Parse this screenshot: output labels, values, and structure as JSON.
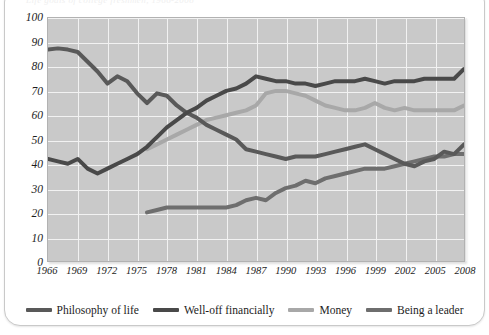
{
  "figure": {
    "clipped_title": "Life goals of college freshmen, 1966-2008",
    "plot_background": "#c9c9c9",
    "gridline_color": "#f2f2f2"
  },
  "chart_data": {
    "type": "line",
    "title": "",
    "xlabel": "",
    "ylabel": "",
    "xlim": [
      1966,
      2008
    ],
    "ylim": [
      0,
      100
    ],
    "grid": true,
    "legend_position": "bottom",
    "x_ticks": [
      1966,
      1969,
      1972,
      1975,
      1978,
      1981,
      1984,
      1987,
      1990,
      1993,
      1996,
      1999,
      2002,
      2005,
      2008
    ],
    "y_ticks": [
      0,
      10,
      20,
      30,
      40,
      50,
      60,
      70,
      80,
      90,
      100
    ],
    "series": [
      {
        "name": "Philosophy of life",
        "color": "#595959",
        "x": [
          1966,
          1967,
          1968,
          1969,
          1970,
          1971,
          1972,
          1973,
          1974,
          1975,
          1976,
          1977,
          1978,
          1979,
          1980,
          1981,
          1982,
          1983,
          1984,
          1985,
          1986,
          1987,
          1988,
          1989,
          1990,
          1991,
          1992,
          1993,
          1994,
          1995,
          1996,
          1997,
          1998,
          1999,
          2000,
          2001,
          2002,
          2003,
          2004,
          2005,
          2006,
          2007,
          2008
        ],
        "values": [
          87,
          87.5,
          87,
          86,
          82,
          78,
          73,
          76,
          74,
          69,
          65,
          69,
          68,
          64,
          61,
          59,
          56,
          54,
          52,
          50,
          46,
          45,
          44,
          43,
          42,
          43,
          43,
          43,
          44,
          45,
          46,
          47,
          48,
          46,
          44,
          42,
          40,
          39,
          41,
          42,
          45,
          44,
          48
        ]
      },
      {
        "name": "Well-off financially",
        "color": "#494949",
        "x": [
          1966,
          1967,
          1968,
          1969,
          1970,
          1971,
          1972,
          1973,
          1974,
          1975,
          1976,
          1977,
          1978,
          1979,
          1980,
          1981,
          1982,
          1983,
          1984,
          1985,
          1986,
          1987,
          1988,
          1989,
          1990,
          1991,
          1992,
          1993,
          1994,
          1995,
          1996,
          1997,
          1998,
          1999,
          2000,
          2001,
          2002,
          2003,
          2004,
          2005,
          2006,
          2007,
          2008
        ],
        "values": [
          42,
          41,
          40,
          42,
          38,
          36,
          38,
          40,
          42,
          44,
          47,
          51,
          55,
          58,
          61,
          63,
          66,
          68,
          70,
          71,
          73,
          76,
          75,
          74,
          74,
          73,
          73,
          72,
          73,
          74,
          74,
          74,
          75,
          74,
          73,
          74,
          74,
          74,
          75,
          75,
          75,
          75,
          79
        ]
      },
      {
        "name": "Money",
        "color": "#a8a8a8",
        "x": [
          1976,
          1977,
          1978,
          1979,
          1980,
          1981,
          1982,
          1983,
          1984,
          1985,
          1986,
          1987,
          1988,
          1989,
          1990,
          1991,
          1992,
          1993,
          1994,
          1995,
          1996,
          1997,
          1998,
          1999,
          2000,
          2001,
          2002,
          2003,
          2004,
          2005,
          2006,
          2007,
          2008
        ],
        "values": [
          46,
          48,
          50,
          52,
          54,
          56,
          58,
          59,
          60,
          61,
          62,
          64,
          69,
          70,
          70,
          69,
          68,
          66,
          64,
          63,
          62,
          62,
          63,
          65,
          63,
          62,
          63,
          62,
          62,
          62,
          62,
          62,
          64
        ]
      },
      {
        "name": "Being a leader",
        "color": "#6e6e6e",
        "x": [
          1976,
          1977,
          1978,
          1979,
          1980,
          1981,
          1982,
          1983,
          1984,
          1985,
          1986,
          1987,
          1988,
          1989,
          1990,
          1991,
          1992,
          1993,
          1994,
          1995,
          1996,
          1997,
          1998,
          1999,
          2000,
          2001,
          2002,
          2003,
          2004,
          2005,
          2006,
          2007,
          2008
        ],
        "values": [
          20,
          21,
          22,
          22,
          22,
          22,
          22,
          22,
          22,
          23,
          25,
          26,
          25,
          28,
          30,
          31,
          33,
          32,
          34,
          35,
          36,
          37,
          38,
          38,
          38,
          39,
          40,
          41,
          42,
          43,
          43,
          44,
          44
        ]
      }
    ]
  },
  "legend": {
    "items": [
      {
        "label": "Philosophy of life",
        "color": "#595959"
      },
      {
        "label": "Well-off financially",
        "color": "#494949"
      },
      {
        "label": "Money",
        "color": "#a8a8a8"
      },
      {
        "label": "Being a leader",
        "color": "#6e6e6e"
      }
    ]
  }
}
